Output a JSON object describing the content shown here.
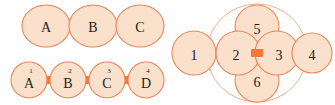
{
  "figure": {
    "background_color": "#ffffff",
    "node_fill": "#fbe0cb",
    "node_stroke": "#e8855a",
    "link_color": "#f4763a",
    "hull_stroke": "#e8a97f",
    "label_color": "#231f20"
  },
  "panels": {
    "top_left": {
      "name": "directed-chain-abc",
      "nodes": [
        {
          "id": "A",
          "label": "A",
          "cx": 46,
          "cy": 26,
          "rx": 24,
          "ry": 21
        },
        {
          "id": "B",
          "label": "B",
          "cx": 93,
          "cy": 26,
          "rx": 24,
          "ry": 21
        },
        {
          "id": "C",
          "label": "C",
          "cx": 140,
          "cy": 26,
          "rx": 24,
          "ry": 21
        }
      ],
      "arrows": [
        {
          "id": "A-B",
          "from": "A",
          "to": "B",
          "x": 62,
          "y": 26
        },
        {
          "id": "B-C",
          "from": "B",
          "to": "C",
          "x": 109,
          "y": 26
        }
      ]
    },
    "bottom_left": {
      "name": "ordered-chain-abcd",
      "nodes": [
        {
          "id": "A",
          "label": "A",
          "index": "1",
          "cx": 29,
          "cy": 80,
          "r": 18
        },
        {
          "id": "B",
          "label": "B",
          "index": "2",
          "cx": 68,
          "cy": 80,
          "r": 18
        },
        {
          "id": "C",
          "label": "C",
          "index": "3",
          "cx": 107,
          "cy": 80,
          "r": 18
        },
        {
          "id": "D",
          "label": "D",
          "index": "4",
          "cx": 146,
          "cy": 80,
          "r": 18
        }
      ],
      "links": [
        {
          "id": "A-B",
          "from": "A",
          "to": "B",
          "x": 45,
          "y": 80
        },
        {
          "id": "B-C",
          "from": "B",
          "to": "C",
          "x": 84,
          "y": 80
        },
        {
          "id": "C-D",
          "from": "C",
          "to": "D",
          "x": 123,
          "y": 80
        }
      ]
    },
    "right": {
      "name": "numbered-cluster-graph",
      "nodes": [
        {
          "id": "1",
          "label": "1",
          "cx": 194,
          "cy": 53,
          "r": 22
        },
        {
          "id": "2",
          "label": "2",
          "cx": 238,
          "cy": 53,
          "r": 22
        },
        {
          "id": "3",
          "label": "3",
          "cx": 277,
          "cy": 53,
          "r": 22
        },
        {
          "id": "4",
          "label": "4",
          "cx": 312,
          "cy": 53,
          "r": 20
        },
        {
          "id": "5",
          "label": "5",
          "cx": 257,
          "cy": 27,
          "r": 22
        },
        {
          "id": "6",
          "label": "6",
          "cx": 257,
          "cy": 80,
          "r": 22
        }
      ],
      "links": [
        {
          "id": "1-2",
          "from": "1",
          "to": "2",
          "x": 216,
          "y": 53
        },
        {
          "id": "2-3",
          "from": "2",
          "to": "3",
          "x": 257,
          "y": 53
        },
        {
          "id": "3-4",
          "from": "3",
          "to": "4",
          "x": 295,
          "y": 53
        }
      ],
      "hull": {
        "id": "cluster-hull",
        "cx": 257,
        "cy": 53,
        "rx": 50,
        "ry": 49
      }
    }
  }
}
